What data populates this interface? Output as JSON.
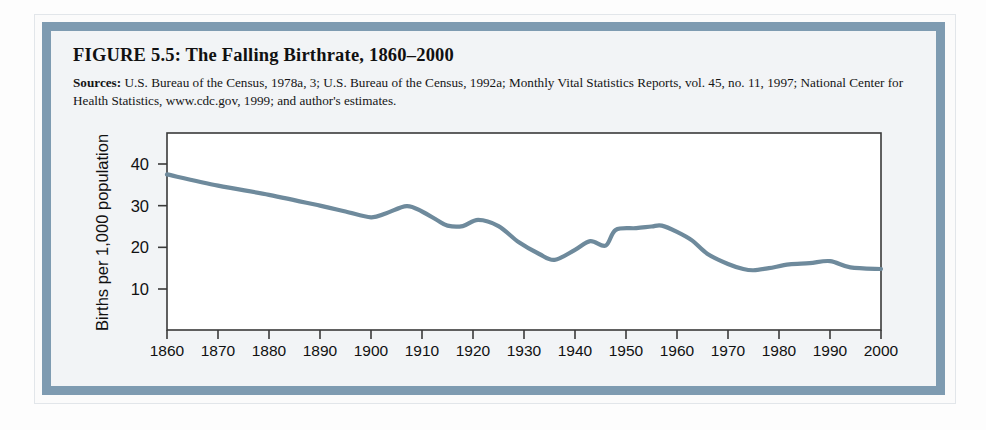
{
  "figure": {
    "title": "FIGURE 5.5:  The Falling Birthrate, 1860–2000",
    "sources_label": "Sources:",
    "sources_text": " U.S. Bureau of the Census, 1978a, 3; U.S. Bureau of the Census, 1992a; Monthly Vital Statistics Reports, vol. 45, no. 11, 1997; National Center for Health Statistics, www.cdc.gov, 1999; and author's estimates."
  },
  "colors": {
    "frame_band": "#7e9bb1",
    "line": "#6e8a9c",
    "axis": "#3a3a3a",
    "inner_background": "#f2f4f6"
  },
  "chart_data": {
    "type": "line",
    "title": "The Falling Birthrate, 1860–2000",
    "xlabel": "",
    "ylabel": "Births per 1,000 population",
    "xlim": [
      1860,
      2000
    ],
    "ylim": [
      0,
      45
    ],
    "grid": false,
    "legend": "none",
    "xticks": [
      1860,
      1870,
      1880,
      1890,
      1900,
      1910,
      1920,
      1930,
      1940,
      1950,
      1960,
      1970,
      1980,
      1990,
      2000
    ],
    "xtick_labels": [
      "1860",
      "1870",
      "1880",
      "1890",
      "1900",
      "1910",
      "1920",
      "1930",
      "1940",
      "1950",
      "1960",
      "1970",
      "1980",
      "1990",
      "2000"
    ],
    "yticks": [
      10,
      20,
      30,
      40
    ],
    "ytick_labels": [
      "10",
      "20",
      "30",
      "40"
    ],
    "series": [
      {
        "name": "Births per 1,000 population",
        "x": [
          1860,
          1870,
          1880,
          1890,
          1895,
          1900,
          1903,
          1907,
          1910,
          1913,
          1915,
          1918,
          1921,
          1925,
          1929,
          1933,
          1936,
          1940,
          1943,
          1946,
          1948,
          1952,
          1955,
          1957,
          1960,
          1963,
          1966,
          1970,
          1973,
          1975,
          1978,
          1982,
          1986,
          1990,
          1994,
          2000
        ],
        "y": [
          37.5,
          34.8,
          32.6,
          30.0,
          28.6,
          27.2,
          28.2,
          29.9,
          28.6,
          26.5,
          25.2,
          25.1,
          26.6,
          25.1,
          21.2,
          18.4,
          17.0,
          19.4,
          21.5,
          20.4,
          24.2,
          24.6,
          25.0,
          25.2,
          23.7,
          21.6,
          18.4,
          16.0,
          14.8,
          14.5,
          15.0,
          15.9,
          16.2,
          16.7,
          15.2,
          14.8
        ]
      }
    ]
  }
}
